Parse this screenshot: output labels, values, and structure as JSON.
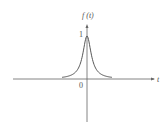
{
  "chart_data": {
    "type": "line",
    "title": "",
    "xlabel": "t",
    "ylabel": "f(t)",
    "function": "Lorentzian-like peak centered at t = 0",
    "peak": {
      "t": 0,
      "value": 1
    },
    "tick_labels": {
      "origin": "0",
      "y_peak": "1"
    },
    "series": [
      {
        "name": "f(t)",
        "x": [
          -1.0,
          -0.8,
          -0.6,
          -0.4,
          -0.3,
          -0.2,
          -0.1,
          0.0,
          0.1,
          0.2,
          0.3,
          0.4,
          0.6,
          0.8,
          1.0
        ],
        "values": [
          0.04,
          0.06,
          0.1,
          0.2,
          0.31,
          0.5,
          0.8,
          1.0,
          0.8,
          0.5,
          0.31,
          0.2,
          0.1,
          0.06,
          0.04
        ]
      }
    ],
    "grid": false,
    "legend": "none"
  },
  "labels": {
    "y_axis": "f (t)",
    "x_axis": "t",
    "origin": "0",
    "peak_tick": "1"
  },
  "colors": {
    "axis": "#555555",
    "curve": "#444444"
  }
}
